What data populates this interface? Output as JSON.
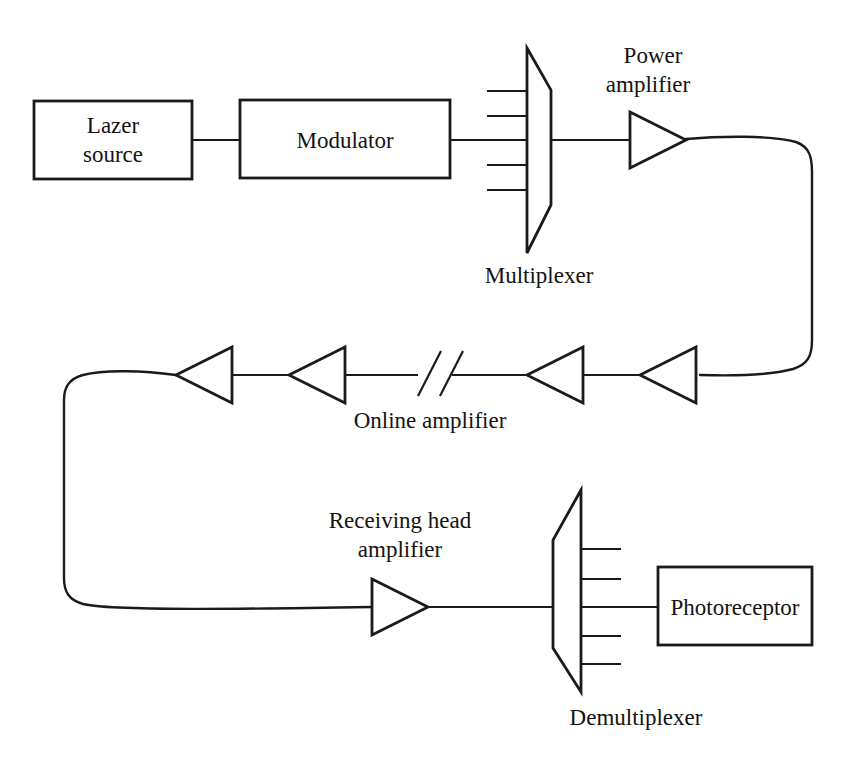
{
  "diagram": {
    "background_color": "#ffffff",
    "line_color": "#1a1a1a",
    "nodes": {
      "lazer_source": {
        "label_line1": "Lazer",
        "label_line2": "source",
        "type": "box"
      },
      "modulator": {
        "label": "Modulator",
        "type": "box"
      },
      "multiplexer": {
        "label": "Multiplexer",
        "type": "trapezoid",
        "ports": 5
      },
      "power_amplifier": {
        "label_line1": "Power",
        "label_line2": "amplifier",
        "type": "triangle-amplifier"
      },
      "online_amplifier": {
        "label": "Online amplifier",
        "type": "triangle-amplifier",
        "count": 4
      },
      "receiving_head_amplifier": {
        "label_line1": "Receiving head",
        "label_line2": "amplifier",
        "type": "triangle-amplifier"
      },
      "demultiplexer": {
        "label": "Demultiplexer",
        "type": "trapezoid",
        "ports": 5
      },
      "photoreceptor": {
        "label": "Photoreceptor",
        "type": "box"
      }
    },
    "labels": [
      {
        "id": "lazer-source-line1",
        "text": "Lazer",
        "x": 113,
        "y": 133
      },
      {
        "id": "lazer-source-line2",
        "text": "source",
        "x": 113,
        "y": 162
      },
      {
        "id": "modulator",
        "text": "Modulator",
        "x": 345,
        "y": 148
      },
      {
        "id": "power-amplifier-line1",
        "text": "Power",
        "x": 653,
        "y": 63
      },
      {
        "id": "power-amplifier-line2",
        "text": "amplifier",
        "x": 648,
        "y": 92
      },
      {
        "id": "multiplexer",
        "text": "Multiplexer",
        "x": 539,
        "y": 283
      },
      {
        "id": "online-amplifier",
        "text": "Online amplifier",
        "x": 430,
        "y": 428
      },
      {
        "id": "receiving-head-amplifier-line1",
        "text": "Receiving head",
        "x": 400,
        "y": 528
      },
      {
        "id": "receiving-head-amplifier-line2",
        "text": "amplifier",
        "x": 400,
        "y": 557
      },
      {
        "id": "demultiplexer",
        "text": "Demultiplexer",
        "x": 636,
        "y": 725
      },
      {
        "id": "photoreceptor",
        "text": "Photoreceptor",
        "x": 735,
        "y": 615
      }
    ]
  }
}
